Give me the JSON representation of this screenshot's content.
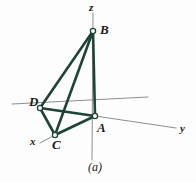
{
  "figure": {
    "caption": "(a)",
    "background_color": "#fdfdfd",
    "edge_color": "#1d4437",
    "axis_color": "#8e8e8e",
    "node_fill": "#fafafa",
    "label_color": "#1a1a1a",
    "axes": [
      {
        "name": "z",
        "label": "z",
        "label_x": 89,
        "label_y": 2,
        "from_x": 93,
        "from_y": 13,
        "to_x": 92,
        "to_y": 160
      },
      {
        "name": "y",
        "label": "y",
        "label_x": 180,
        "label_y": 123,
        "from_x": 95,
        "from_y": 116,
        "to_x": 176,
        "to_y": 128
      },
      {
        "name": "x",
        "label": "x",
        "label_x": 30,
        "label_y": 136,
        "from_x": 55,
        "from_y": 135,
        "to_x": 40,
        "to_y": 143
      },
      {
        "name": "d-axis",
        "label": "",
        "label_x": 0,
        "label_y": 0,
        "from_x": 12,
        "from_y": 104,
        "to_x": 148,
        "to_y": 97
      }
    ],
    "nodes": [
      {
        "id": "B",
        "label": "B",
        "x": 93,
        "y": 31,
        "label_x": 100,
        "label_y": 23
      },
      {
        "id": "D",
        "label": "D",
        "x": 40,
        "y": 108,
        "label_x": 29,
        "label_y": 95
      },
      {
        "id": "C",
        "label": "C",
        "x": 55,
        "y": 135,
        "label_x": 52,
        "label_y": 138
      },
      {
        "id": "A",
        "label": "A",
        "x": 95,
        "y": 116,
        "label_x": 97,
        "label_y": 121
      }
    ],
    "edges": [
      {
        "id": "BD",
        "from": "B",
        "to": "D"
      },
      {
        "id": "BC",
        "from": "B",
        "to": "C"
      },
      {
        "id": "BA",
        "from": "B",
        "to": "A"
      },
      {
        "id": "DC",
        "from": "D",
        "to": "C"
      },
      {
        "id": "DA",
        "from": "D",
        "to": "A"
      },
      {
        "id": "CA",
        "from": "C",
        "to": "A"
      }
    ]
  }
}
